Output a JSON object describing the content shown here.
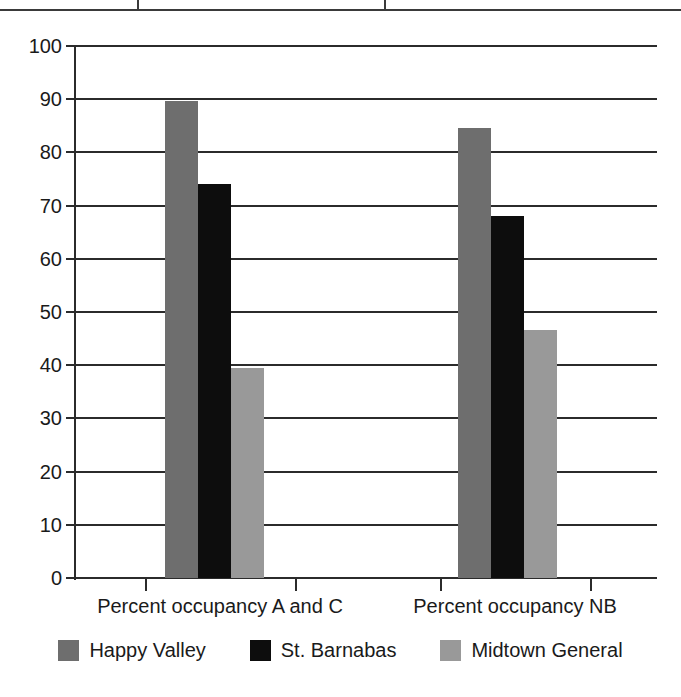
{
  "figure": {
    "top_rule_ticks": [
      137,
      384
    ]
  },
  "chart_data": {
    "type": "bar",
    "title": "",
    "subtitle": "",
    "xlabel": "",
    "ylabel": "",
    "categories": [
      "Percent occupancy A and C",
      "Percent occupancy NB"
    ],
    "series": [
      {
        "name": "Happy Valley",
        "color": "#6e6e6e",
        "values": [
          89.7,
          84.6
        ]
      },
      {
        "name": "St. Barnabas",
        "color": "#0d0d0d",
        "values": [
          74.0,
          68.0
        ]
      },
      {
        "name": "Midtown General",
        "color": "#999999",
        "values": [
          39.4,
          46.6
        ]
      }
    ],
    "ylim": [
      0,
      100
    ],
    "ytick_values": [
      0,
      10,
      20,
      30,
      40,
      50,
      60,
      70,
      80,
      90,
      100
    ],
    "ytick_labels": [
      "0",
      "10",
      "20",
      "30",
      "40",
      "50",
      "60",
      "70",
      "80",
      "90",
      "100"
    ],
    "grid": true,
    "grid_axis": "y",
    "legend_position": "bottom",
    "bar_group_gap": true,
    "background": "#ffffff",
    "axis_color": "#2b2b2b"
  },
  "legend": {
    "items": [
      {
        "label": "Happy Valley",
        "color": "#6e6e6e"
      },
      {
        "label": "St. Barnabas",
        "color": "#0d0d0d"
      },
      {
        "label": "Midtown General",
        "color": "#999999"
      }
    ]
  }
}
